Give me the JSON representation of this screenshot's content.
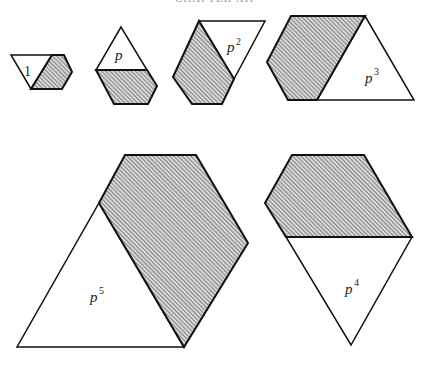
{
  "header": {
    "text": "CHAPTER XII"
  },
  "figure": {
    "stroke_color": "#111111",
    "hatch_color": "#555555",
    "fill_white": "#ffffff",
    "shapes": [
      {
        "id": "s1",
        "label": "1",
        "exponent": ""
      },
      {
        "id": "sp",
        "label": "p",
        "exponent": ""
      },
      {
        "id": "sp2",
        "label": "p",
        "exponent": "2"
      },
      {
        "id": "sp3",
        "label": "p",
        "exponent": "3"
      },
      {
        "id": "sp5",
        "label": "p",
        "exponent": "5"
      },
      {
        "id": "sp4",
        "label": "p",
        "exponent": "4"
      }
    ]
  }
}
